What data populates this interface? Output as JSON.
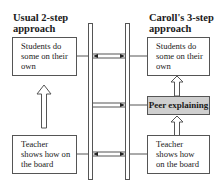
{
  "diagram": {
    "left": {
      "title_line1": "Usual 2-step",
      "title_line2": "approach",
      "top_box": "Students do some on their own",
      "bottom_box": "Teacher shows how on the board"
    },
    "right": {
      "title_line1": "Caroll's 3-step",
      "title_line2": "approach",
      "top_box": "Students do some on their own",
      "middle_box": "Peer explaining",
      "bottom_box": "Teacher shows how on the board"
    },
    "center": {
      "element": "ladder",
      "rungs": [
        {
          "position": "top",
          "arrows": "double"
        },
        {
          "position": "middle",
          "arrows": "single-left"
        },
        {
          "position": "bottom",
          "arrows": "double"
        }
      ]
    },
    "colors": {
      "box_border": "#555555",
      "highlight_fill": "#cfcfcf",
      "line": "#555555"
    }
  }
}
